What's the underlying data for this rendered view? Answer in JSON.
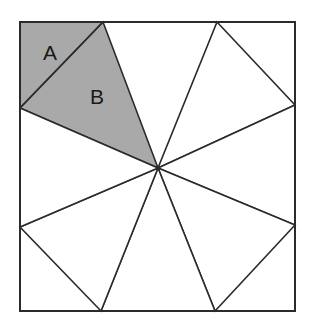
{
  "figure": {
    "canvas": {
      "width": 313,
      "height": 326,
      "background": "#ffffff"
    },
    "square": {
      "label": "outer-square",
      "left": 20,
      "top": 22,
      "right": 295,
      "bottom": 311,
      "stroke": "#2b2b2b",
      "stroke_width": 2,
      "fill": "#ffffff"
    },
    "center_point": {
      "x": 158,
      "y": 168,
      "label": "center"
    },
    "edge_vertices": {
      "top_left_tick": {
        "x": 103,
        "y": 22
      },
      "top_right_tick": {
        "x": 217,
        "y": 22
      },
      "right_top_tick": {
        "x": 295,
        "y": 105
      },
      "right_bottom_tick": {
        "x": 295,
        "y": 225
      },
      "bottom_right_tick": {
        "x": 215,
        "y": 311
      },
      "bottom_left_tick": {
        "x": 101,
        "y": 311
      },
      "left_bottom_tick": {
        "x": 20,
        "y": 227
      },
      "left_top_tick": {
        "x": 20,
        "y": 108
      }
    },
    "corners": {
      "top_left": {
        "x": 20,
        "y": 22
      },
      "top_right": {
        "x": 295,
        "y": 22
      },
      "bottom_right": {
        "x": 295,
        "y": 311
      },
      "bottom_left": {
        "x": 20,
        "y": 311
      }
    },
    "colors": {
      "shaded_fill": "#a9a9a9",
      "unshaded_fill": "#ffffff",
      "stroke": "#2b2b2b",
      "label_text": "#1a1a1a"
    },
    "shaded_corner_triangle": {
      "name": "region-a",
      "points": "20,22 103,22 20,108",
      "fill": "#a9a9a9"
    },
    "shaded_pinwheel_triangle": {
      "name": "region-b",
      "points": "103,22 158,168 20,108",
      "fill": "#a9a9a9"
    },
    "pinwheel_triangles": [
      {
        "name": "triangle-top-left",
        "points": "103,22 158,168 20,108",
        "fill": "#a9a9a9",
        "shaded": true
      },
      {
        "name": "triangle-top-right",
        "points": "217,22 295,105 158,168",
        "fill": "#ffffff",
        "shaded": false
      },
      {
        "name": "triangle-right",
        "points": "295,105 295,225 158,168",
        "fill": "#ffffff",
        "shaded": false
      },
      {
        "name": "triangle-bottom-right",
        "points": "295,225 215,311 158,168",
        "fill": "#ffffff",
        "shaded": false
      },
      {
        "name": "triangle-bottom",
        "points": "215,311 101,311 158,168",
        "fill": "#ffffff",
        "shaded": false
      },
      {
        "name": "triangle-bottom-left",
        "points": "101,311 20,227 158,168",
        "fill": "#ffffff",
        "shaded": false
      },
      {
        "name": "triangle-left",
        "points": "20,227 20,108 158,168",
        "fill": "#ffffff",
        "shaded": false
      }
    ],
    "labels": [
      {
        "name": "label-a",
        "text": "A",
        "x": 50,
        "y": 54
      },
      {
        "name": "label-b",
        "text": "B",
        "x": 97,
        "y": 98
      }
    ]
  }
}
